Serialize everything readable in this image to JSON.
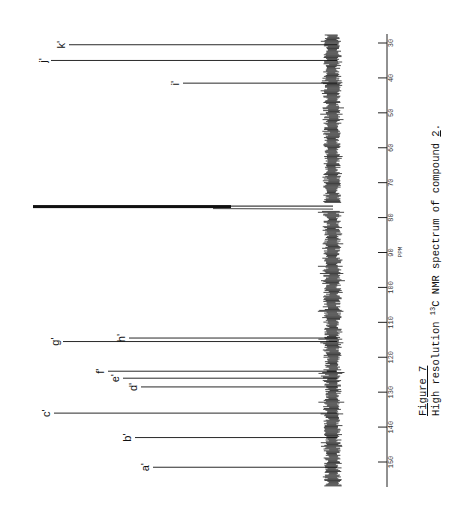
{
  "figure": {
    "title": "Figure 7",
    "caption_prefix": "High resolution ",
    "caption_isotope_mass": "13",
    "caption_isotope": "C",
    "caption_mid": " NMR spectrum of compound ",
    "caption_compound": "2",
    "caption_suffix": "."
  },
  "chart_data": {
    "type": "line",
    "title": "High resolution 13C NMR spectrum of compound 2",
    "orientation": "rotated-90 (ppm axis vertical, peaks extend leftward)",
    "xlabel": "PPM",
    "ylabel": "",
    "xlim": [
      27,
      157
    ],
    "x_ticks": [
      30,
      40,
      50,
      60,
      70,
      80,
      90,
      100,
      110,
      120,
      130,
      140,
      150
    ],
    "x_tick_labels": [
      "30",
      "40",
      "50",
      "60",
      "70",
      "80",
      "90",
      "100",
      "110",
      "120",
      "130",
      "140",
      "150"
    ],
    "grid": false,
    "legend": null,
    "peaks": [
      {
        "label": "k'",
        "ppm": 30.5,
        "intensity": 0.88
      },
      {
        "label": "j'",
        "ppm": 35.0,
        "intensity": 0.94
      },
      {
        "label": "i'",
        "ppm": 41.5,
        "intensity": 0.5
      },
      {
        "label": "solvent (CDCl3)",
        "ppm": 77.0,
        "intensity": 1.0
      },
      {
        "label": "h'",
        "ppm": 114.5,
        "intensity": 0.68
      },
      {
        "label": "g'",
        "ppm": 115.5,
        "intensity": 0.9
      },
      {
        "label": "f'",
        "ppm": 124.0,
        "intensity": 0.75
      },
      {
        "label": "e'",
        "ppm": 126.0,
        "intensity": 0.7
      },
      {
        "label": "d'",
        "ppm": 128.5,
        "intensity": 0.64
      },
      {
        "label": "c'",
        "ppm": 136.0,
        "intensity": 0.93
      },
      {
        "label": "b'",
        "ppm": 143.0,
        "intensity": 0.66
      },
      {
        "label": "a'",
        "ppm": 151.5,
        "intensity": 0.6
      }
    ]
  },
  "colors": {
    "ink": "#111111",
    "background": "#ffffff"
  }
}
